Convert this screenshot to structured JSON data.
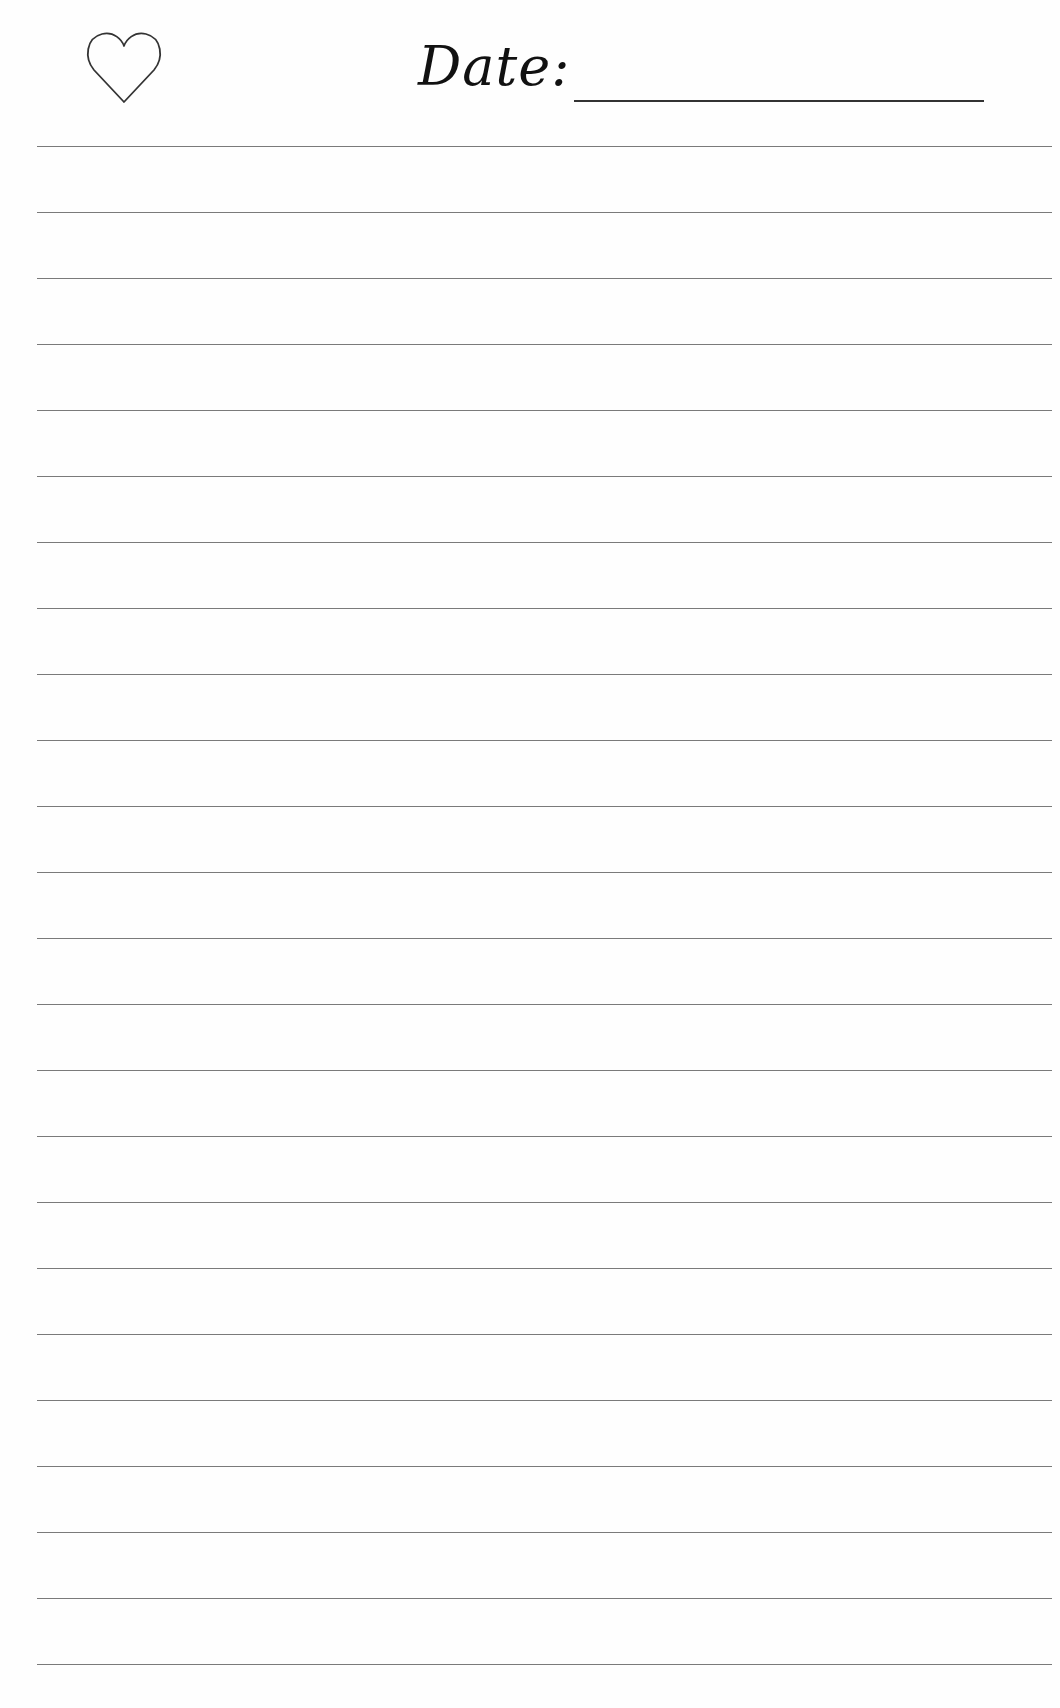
{
  "header": {
    "icon": "heart-outline-icon",
    "date_label": "Date:",
    "date_value": ""
  },
  "ruled_lines": {
    "count": 24,
    "first_y": 146,
    "spacing": 66,
    "color": "#7a7a7a"
  },
  "colors": {
    "paper": "#fefefe",
    "ink": "#111111"
  }
}
